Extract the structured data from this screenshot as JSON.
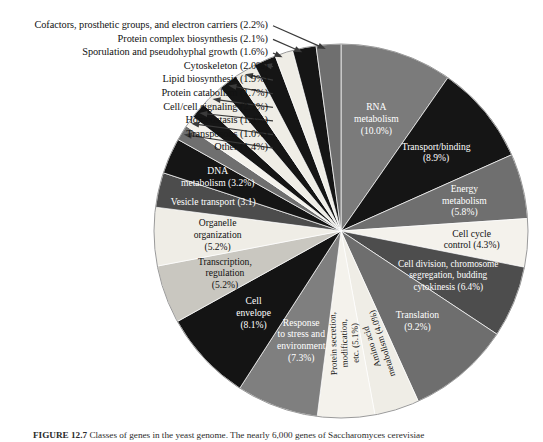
{
  "figure": {
    "caption_label": "FIGURE 12.7",
    "caption_text": "Classes of genes in the yeast genome. The nearly 6,000 genes of Saccharomyces cerevisiae"
  },
  "chart_data": {
    "type": "pie",
    "title": "",
    "units": "percent",
    "start_angle_deg": -90,
    "direction": "clockwise",
    "center": [
      341,
      231
    ],
    "radius": 187,
    "labels_inside": [
      "RNA metabolism",
      "Transport/binding",
      "Energy metabolism",
      "Cell cycle control",
      "Cell division, chromosome segregation, budding cytokinesis",
      "Translation",
      "Amino acid metabolism",
      "Protein secretion, modification, etc.",
      "Response to stress and environment",
      "Cell envelope",
      "Transcription, regulation",
      "Organelle organization",
      "Vesicle transport",
      "DNA metabolism"
    ],
    "labels_callout": [
      "Other",
      "Transposons",
      "Homeostasis",
      "Cell/cell signaling",
      "Protein catabolism",
      "Lipid biosynthesis",
      "Cytoskeleton",
      "Sporulation and pseudohyphal growth",
      "Protein complex biosynthesis",
      "Cofactors, prosthetic groups, and electron carriers"
    ],
    "categories": [
      "RNA metabolism",
      "Transport/binding",
      "Energy metabolism",
      "Cell cycle control",
      "Cell division, chromosome segregation, budding cytokinesis",
      "Translation",
      "Amino acid metabolism",
      "Protein secretion, modification, etc.",
      "Response to stress and environment",
      "Cell envelope",
      "Transcription, regulation",
      "Organelle organization",
      "Vesicle transport",
      "DNA metabolism",
      "Other",
      "Transposons",
      "Homeostasis",
      "Cell/cell signaling",
      "Protein catabolism",
      "Lipid biosynthesis",
      "Cytoskeleton",
      "Sporulation and pseudohyphal growth",
      "Protein complex biosynthesis",
      "Cofactors, prosthetic groups, and electron carriers"
    ],
    "values": [
      10.0,
      8.9,
      5.8,
      4.3,
      6.4,
      9.2,
      4.0,
      5.1,
      7.3,
      8.1,
      5.2,
      5.2,
      3.1,
      3.2,
      1.4,
      1.0,
      1.4,
      2.1,
      1.7,
      1.9,
      2.0,
      1.6,
      2.1,
      2.2
    ],
    "colors": [
      "#7b7b7b",
      "#151515",
      "#6f6f6f",
      "#f4f2ec",
      "#4d4d4d",
      "#6e6e6e",
      "#efede6",
      "#f4f2ec",
      "#7f7f7f",
      "#141414",
      "#c9c7c0",
      "#efede6",
      "#4c4c4c",
      "#151515",
      "#6f6f6f",
      "#f4f2ec",
      "#151515",
      "#efede6",
      "#151515",
      "#efede6",
      "#151515",
      "#efede6",
      "#151515",
      "#6f6f6f"
    ],
    "slices": [
      {
        "label": "RNA metabolism",
        "value": 10.0,
        "display": "RNA\nmetabolism\n(10.0%)",
        "color": "#7b7b7b",
        "text_color": "#ffffff",
        "label_kind": "inside"
      },
      {
        "label": "Transport/binding",
        "value": 8.9,
        "display": "Transport/binding\n(8.9%)",
        "color": "#151515",
        "text_color": "#ffffff",
        "label_kind": "inside"
      },
      {
        "label": "Energy metabolism",
        "value": 5.8,
        "display": "Energy\nmetabolism\n(5.8%)",
        "color": "#6f6f6f",
        "text_color": "#ffffff",
        "label_kind": "inside"
      },
      {
        "label": "Cell cycle control",
        "value": 4.3,
        "display": "Cell cycle\ncontrol (4.3%)",
        "color": "#f4f2ec",
        "text_color": "#111111",
        "label_kind": "inside"
      },
      {
        "label": "Cell division, chromosome segregation, budding cytokinesis",
        "value": 6.4,
        "display": "Cell division, chromosome\nsegregation, budding\ncytokinesis (6.4%)",
        "color": "#4d4d4d",
        "text_color": "#ffffff",
        "label_kind": "inside"
      },
      {
        "label": "Translation",
        "value": 9.2,
        "display": "Translation\n(9.2%)",
        "color": "#6e6e6e",
        "text_color": "#ffffff",
        "label_kind": "inside"
      },
      {
        "label": "Amino acid metabolism",
        "value": 4.0,
        "display": "Amino acid\nmetabolism (4.0%)",
        "color": "#efede6",
        "text_color": "#111111",
        "label_kind": "inside-rotated"
      },
      {
        "label": "Protein secretion, modification, etc.",
        "value": 5.1,
        "display": "Protein secretion,\nmodification,\netc. (5.1%)",
        "color": "#f4f2ec",
        "text_color": "#111111",
        "label_kind": "inside-rotated"
      },
      {
        "label": "Response to stress and environment",
        "value": 7.3,
        "display": "Response\nto stress and\nenvironment\n(7.3%)",
        "color": "#7f7f7f",
        "text_color": "#ffffff",
        "label_kind": "inside"
      },
      {
        "label": "Cell envelope",
        "value": 8.1,
        "display": "Cell\nenvelope\n(8.1%)",
        "color": "#141414",
        "text_color": "#ffffff",
        "label_kind": "inside"
      },
      {
        "label": "Transcription, regulation",
        "value": 5.2,
        "display": "Transcription,\nregulation\n(5.2%)",
        "color": "#c9c7c0",
        "text_color": "#111111",
        "label_kind": "inside"
      },
      {
        "label": "Organelle organization",
        "value": 5.2,
        "display": "Organelle\norganization\n(5.2%)",
        "color": "#efede6",
        "text_color": "#111111",
        "label_kind": "inside"
      },
      {
        "label": "Vesicle transport",
        "value": 3.1,
        "display": "Vesicle transport (3.1)",
        "color": "#4c4c4c",
        "text_color": "#ffffff",
        "label_kind": "inside"
      },
      {
        "label": "DNA metabolism",
        "value": 3.2,
        "display": "DNA\nmetabolism (3.2%)",
        "color": "#151515",
        "text_color": "#ffffff",
        "label_kind": "inside"
      },
      {
        "label": "Other",
        "value": 1.4,
        "display": "Other (1.4%)",
        "color": "#6f6f6f",
        "text_color": "#111111",
        "label_kind": "callout"
      },
      {
        "label": "Transposons",
        "value": 1.0,
        "display": "Transposons (1.0%)",
        "color": "#f4f2ec",
        "text_color": "#111111",
        "label_kind": "callout"
      },
      {
        "label": "Homeostasis",
        "value": 1.4,
        "display": "Homeostasis (1.4%)",
        "color": "#151515",
        "text_color": "#111111",
        "label_kind": "callout"
      },
      {
        "label": "Cell/cell signaling",
        "value": 2.1,
        "display": "Cell/cell signaling (2.1%)",
        "color": "#efede6",
        "text_color": "#111111",
        "label_kind": "callout"
      },
      {
        "label": "Protein catabolism",
        "value": 1.7,
        "display": "Protein catabolism (1.7%)",
        "color": "#151515",
        "text_color": "#111111",
        "label_kind": "callout"
      },
      {
        "label": "Lipid biosynthesis",
        "value": 1.9,
        "display": "Lipid biosynthesis (1.9%)",
        "color": "#efede6",
        "text_color": "#111111",
        "label_kind": "callout"
      },
      {
        "label": "Cytoskeleton",
        "value": 2.0,
        "display": "Cytoskeleton (2.0%)",
        "color": "#151515",
        "text_color": "#111111",
        "label_kind": "callout"
      },
      {
        "label": "Sporulation and pseudohyphal growth",
        "value": 1.6,
        "display": "Sporulation and pseudohyphal growth (1.6%)",
        "color": "#efede6",
        "text_color": "#111111",
        "label_kind": "callout"
      },
      {
        "label": "Protein complex biosynthesis",
        "value": 2.1,
        "display": "Protein complex biosynthesis (2.1%)",
        "color": "#151515",
        "text_color": "#111111",
        "label_kind": "callout"
      },
      {
        "label": "Cofactors, prosthetic groups, and electron carriers",
        "value": 2.2,
        "display": "Cofactors, prosthetic groups, and electron carriers (2.2%)",
        "color": "#6f6f6f",
        "text_color": "#111111",
        "label_kind": "callout"
      }
    ],
    "callouts": [
      {
        "text": "Cofactors, prosthetic groups, and electron carriers (2.2%)"
      },
      {
        "text": "Protein complex biosynthesis (2.1%)"
      },
      {
        "text": "Sporulation and pseudohyphal growth (1.6%)"
      },
      {
        "text": "Cytoskeleton (2.0%)"
      },
      {
        "text": "Lipid biosynthesis (1.9%)"
      },
      {
        "text": "Protein catabolism (1.7%)"
      },
      {
        "text": "Cell/cell signaling (2.1%)"
      },
      {
        "text": "Homeostasis (1.4%)"
      },
      {
        "text": "Transposons (1.0%)"
      },
      {
        "text": "Other (1.4%)"
      }
    ],
    "inside_labels": [
      {
        "lines": [
          "RNA",
          "metabolism",
          "(10.0%)"
        ]
      },
      {
        "lines": [
          "Transport/binding",
          "(8.9%)"
        ]
      },
      {
        "lines": [
          "Energy",
          "metabolism",
          "(5.8%)"
        ]
      },
      {
        "lines": [
          "Cell cycle",
          "control (4.3%)"
        ]
      },
      {
        "lines": [
          "Cell division, chromosome",
          "segregation, budding",
          "cytokinesis (6.4%)"
        ]
      },
      {
        "lines": [
          "Translation",
          "(9.2%)"
        ]
      },
      {
        "lines": [
          "Amino acid",
          "metabolism (4.0%)"
        ]
      },
      {
        "lines": [
          "Protein secretion,",
          "modification,",
          "etc. (5.1%)"
        ]
      },
      {
        "lines": [
          "Response",
          "to stress and",
          "environment",
          "(7.3%)"
        ]
      },
      {
        "lines": [
          "Cell",
          "envelope",
          "(8.1%)"
        ]
      },
      {
        "lines": [
          "Transcription,",
          "regulation",
          "(5.2%)"
        ]
      },
      {
        "lines": [
          "Organelle",
          "organization",
          "(5.2%)"
        ]
      },
      {
        "lines": [
          "Vesicle transport (3.1)"
        ]
      },
      {
        "lines": [
          "DNA",
          "metabolism (3.2%)"
        ]
      }
    ]
  }
}
